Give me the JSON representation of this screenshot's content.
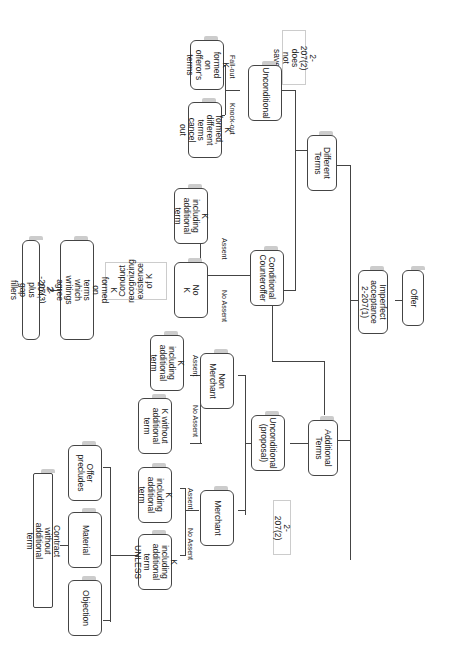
{
  "diagram": {
    "topic": "UCC 2-207 flowchart",
    "nodes": {
      "offer": "Offer",
      "imperfect": "Imperfect\nacceptance\n2-207(1)",
      "different": "Different\nTerms",
      "additional": "Additional\nTerms",
      "unconditional_diff": "Unconditional",
      "k_offeror": "K formed on\nofferor's\nterms",
      "k_knockout": "K formed,\ndifferent\nterms cancel\nout",
      "conditional": "Conditional\nCounteroffer",
      "k_incl_assent": "K including\nadditional\nterm",
      "no_k": "No K",
      "k_writings": "K formed on terms\nwhich writings agree 2\n-207(3)",
      "gap_fillers": "2-204, plus gap fillers",
      "unconditional_prop": "Unconditional\n(proposal)",
      "non_merchant": "Non Merchant",
      "k_incl_nm": "K including\nadditional\nterm",
      "k_without": "K without\nadditional\nterm",
      "merchant": "Merchant",
      "k_incl_m": "K including\nadditional\nterm",
      "k_unless": "K including\nadditional\nterm UNLESS",
      "offer_precludes": "Offer\nprecludes",
      "material": "Material",
      "objection": "Objection",
      "contract_without": "Contract without additional term"
    },
    "notes": {
      "does_not_save": "2-207(2)\ndoes not save",
      "conduct": "Conduct\nrecognizing\nexistence of K",
      "s2072": "2-207(2)"
    },
    "edge_labels": {
      "fall_out": "Fall-out",
      "knock_out": "Knock-out",
      "assent": "Assent",
      "no_assent": "No Assent"
    }
  }
}
